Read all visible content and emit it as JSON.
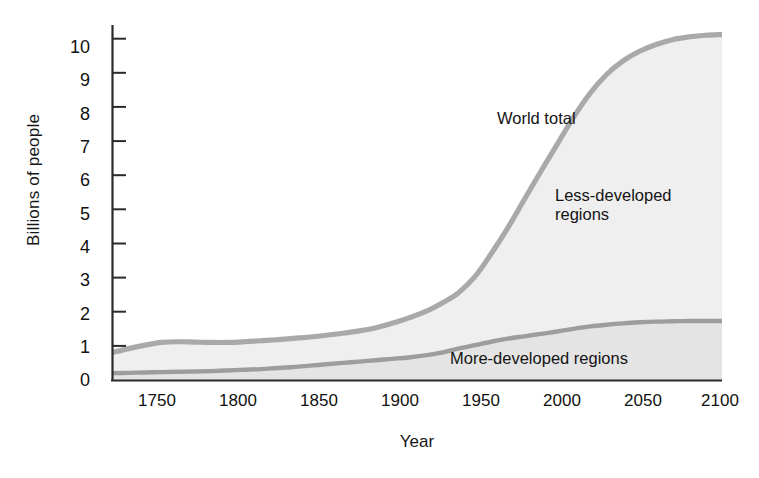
{
  "chart_data": {
    "type": "area",
    "title": "",
    "subtitle": "",
    "xlabel": "Year",
    "ylabel": "Billions of people",
    "xlim": [
      1740,
      2110
    ],
    "ylim": [
      0,
      10.4
    ],
    "xticks": [
      1750,
      1800,
      1850,
      1900,
      1950,
      2000,
      2050,
      2100
    ],
    "yticks": [
      0,
      1,
      2,
      3,
      4,
      5,
      6,
      7,
      8,
      9,
      10
    ],
    "grid": false,
    "legend_position": "inline-annotations",
    "annotations": [
      {
        "text": "World total",
        "x": 1975,
        "y": 7.5
      },
      {
        "text": "Less-developed\nregions",
        "x": 2020,
        "y": 5.4
      },
      {
        "text": "More-developed regions",
        "x": 2020,
        "y": 0.8
      }
    ],
    "x": [
      1740,
      1750,
      1760,
      1770,
      1780,
      1790,
      1800,
      1810,
      1820,
      1830,
      1840,
      1850,
      1860,
      1870,
      1880,
      1890,
      1900,
      1910,
      1920,
      1930,
      1940,
      1950,
      1960,
      1970,
      1980,
      1990,
      2000,
      2010,
      2020,
      2030,
      2040,
      2050,
      2060,
      2070,
      2080,
      2090,
      2100,
      2110
    ],
    "series": [
      {
        "name": "World total",
        "color": "#a9a9a9",
        "values": [
          0.8,
          0.92,
          1.02,
          1.1,
          1.12,
          1.11,
          1.1,
          1.1,
          1.12,
          1.15,
          1.18,
          1.22,
          1.26,
          1.31,
          1.37,
          1.44,
          1.53,
          1.66,
          1.82,
          2.0,
          2.25,
          2.55,
          3.02,
          3.7,
          4.45,
          5.28,
          6.1,
          6.9,
          7.7,
          8.4,
          8.95,
          9.35,
          9.63,
          9.83,
          9.97,
          10.05,
          10.1,
          10.12
        ]
      },
      {
        "name": "More-developed regions",
        "color": "#9a9a9a",
        "values": [
          0.2,
          0.21,
          0.22,
          0.23,
          0.24,
          0.25,
          0.26,
          0.28,
          0.3,
          0.32,
          0.35,
          0.38,
          0.42,
          0.46,
          0.5,
          0.54,
          0.58,
          0.62,
          0.66,
          0.72,
          0.8,
          0.92,
          1.02,
          1.12,
          1.21,
          1.28,
          1.35,
          1.42,
          1.5,
          1.57,
          1.62,
          1.66,
          1.69,
          1.71,
          1.72,
          1.73,
          1.73,
          1.73
        ]
      }
    ],
    "colors": {
      "axis": "#2b2b2b",
      "line": "#a9a9a9",
      "fill_less_developed": "#efefef",
      "fill_more_developed": "#e8e8e8",
      "background": "#ffffff",
      "text": "#141414"
    }
  }
}
